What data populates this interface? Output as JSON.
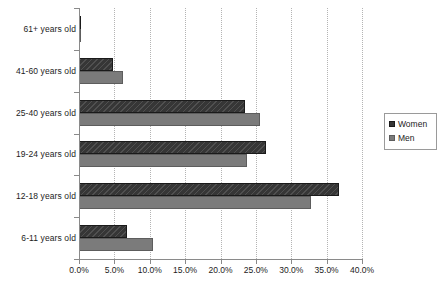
{
  "chart_data": {
    "type": "bar",
    "orientation": "horizontal",
    "title": "",
    "subtitle": "",
    "xlabel": "",
    "ylabel": "",
    "xlim": [
      0,
      40
    ],
    "xtick_labels": [
      "0.0%",
      "5.0%",
      "10.0%",
      "15.0%",
      "20.0%",
      "25.0%",
      "30.0%",
      "35.0%",
      "40.0%"
    ],
    "xtick_values": [
      0,
      5,
      10,
      15,
      20,
      25,
      30,
      35,
      40
    ],
    "grid": "vertical-dotted",
    "legend_position": "right",
    "categories": [
      "61+ years old",
      "41-60 years old",
      "25-40 years old",
      "19-24 years old",
      "12-18 years old",
      "6-11 years old"
    ],
    "series": [
      {
        "name": "Women",
        "color": "#363636",
        "values": [
          0.3,
          4.8,
          23.5,
          26.5,
          36.8,
          6.8
        ]
      },
      {
        "name": "Men",
        "color": "#7b7b7b",
        "values": [
          0.2,
          6.2,
          25.6,
          23.7,
          32.8,
          10.4
        ]
      }
    ]
  },
  "legend": {
    "entries": [
      {
        "label": "Women",
        "swatch": "women"
      },
      {
        "label": "Men",
        "swatch": "men"
      }
    ]
  }
}
